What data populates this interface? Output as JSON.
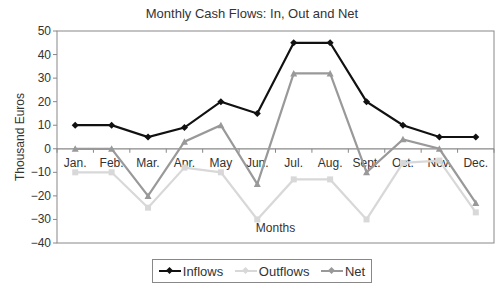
{
  "chart_data": {
    "type": "line",
    "title": "Monthly Cash Flows: In, Out and Net",
    "xlabel": "Months",
    "ylabel": "Thousand Euros",
    "ylim": [
      -40,
      50
    ],
    "yticks": [
      50,
      40,
      30,
      20,
      10,
      0,
      -10,
      -20,
      -30,
      -40
    ],
    "grid": false,
    "legend_position": "bottom",
    "categories": [
      "Jan.",
      "Feb.",
      "Mar.",
      "Apr.",
      "May",
      "Jun.",
      "Jul.",
      "Aug.",
      "Sept.",
      "Oct.",
      "Nov.",
      "Dec."
    ],
    "series": [
      {
        "name": "Inflows",
        "color": "#111111",
        "marker": "diamond",
        "values": [
          10,
          10,
          5,
          9,
          20,
          15,
          45,
          45,
          20,
          10,
          5,
          5
        ]
      },
      {
        "name": "Outflows",
        "color": "#d8d8d8",
        "marker": "square",
        "values": [
          -10,
          -10,
          -25,
          -8,
          -10,
          -30,
          -13,
          -13,
          -30,
          -6,
          -5,
          -27
        ]
      },
      {
        "name": "Net",
        "color": "#999999",
        "marker": "triangle",
        "values": [
          0,
          0,
          -20,
          3,
          10,
          -15,
          32,
          32,
          -10,
          4,
          0,
          -23
        ]
      }
    ]
  },
  "legend": {
    "items": [
      {
        "label": "Inflows",
        "color": "#111111"
      },
      {
        "label": "Outflows",
        "color": "#d8d8d8"
      },
      {
        "label": "Net",
        "color": "#999999"
      }
    ]
  }
}
